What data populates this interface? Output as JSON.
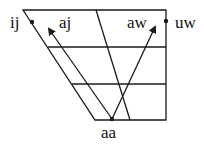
{
  "diagram": {
    "type": "vowel-trapezoid",
    "labels": {
      "ij": "ij",
      "aj": "aj",
      "aw": "aw",
      "uw": "uw",
      "aa": "aa"
    },
    "colors": {
      "line": "#1a1a1a",
      "background": "#ffffff"
    },
    "points": {
      "ij": [
        32,
        22
      ],
      "uw": [
        166,
        21
      ],
      "aa": [
        112,
        119
      ]
    },
    "arrows": [
      {
        "from": "aa",
        "to_label": "aj",
        "end": [
          48,
          28
        ]
      },
      {
        "from": "aa",
        "to_label": "aw",
        "end": [
          155,
          26
        ]
      }
    ]
  }
}
